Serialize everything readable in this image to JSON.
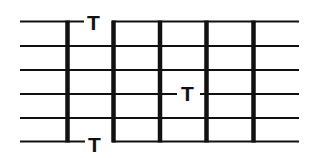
{
  "diagram": {
    "type": "chord-tab-grid",
    "colors": {
      "line": "#111111",
      "background": "#ffffff"
    },
    "strings": [
      {
        "index": 1,
        "y": 21
      },
      {
        "index": 2,
        "y": 46
      },
      {
        "index": 3,
        "y": 70
      },
      {
        "index": 4,
        "y": 94
      },
      {
        "index": 5,
        "y": 118
      },
      {
        "index": 6,
        "y": 141
      }
    ],
    "bars": [
      {
        "index": 1,
        "x": 67
      },
      {
        "index": 2,
        "x": 113
      },
      {
        "index": 3,
        "x": 160
      },
      {
        "index": 4,
        "x": 206
      },
      {
        "index": 5,
        "x": 253
      }
    ],
    "markers": [
      {
        "label": "T",
        "position": "top"
      },
      {
        "label": "T",
        "position": "middle"
      },
      {
        "label": "T",
        "position": "bottom"
      }
    ]
  }
}
